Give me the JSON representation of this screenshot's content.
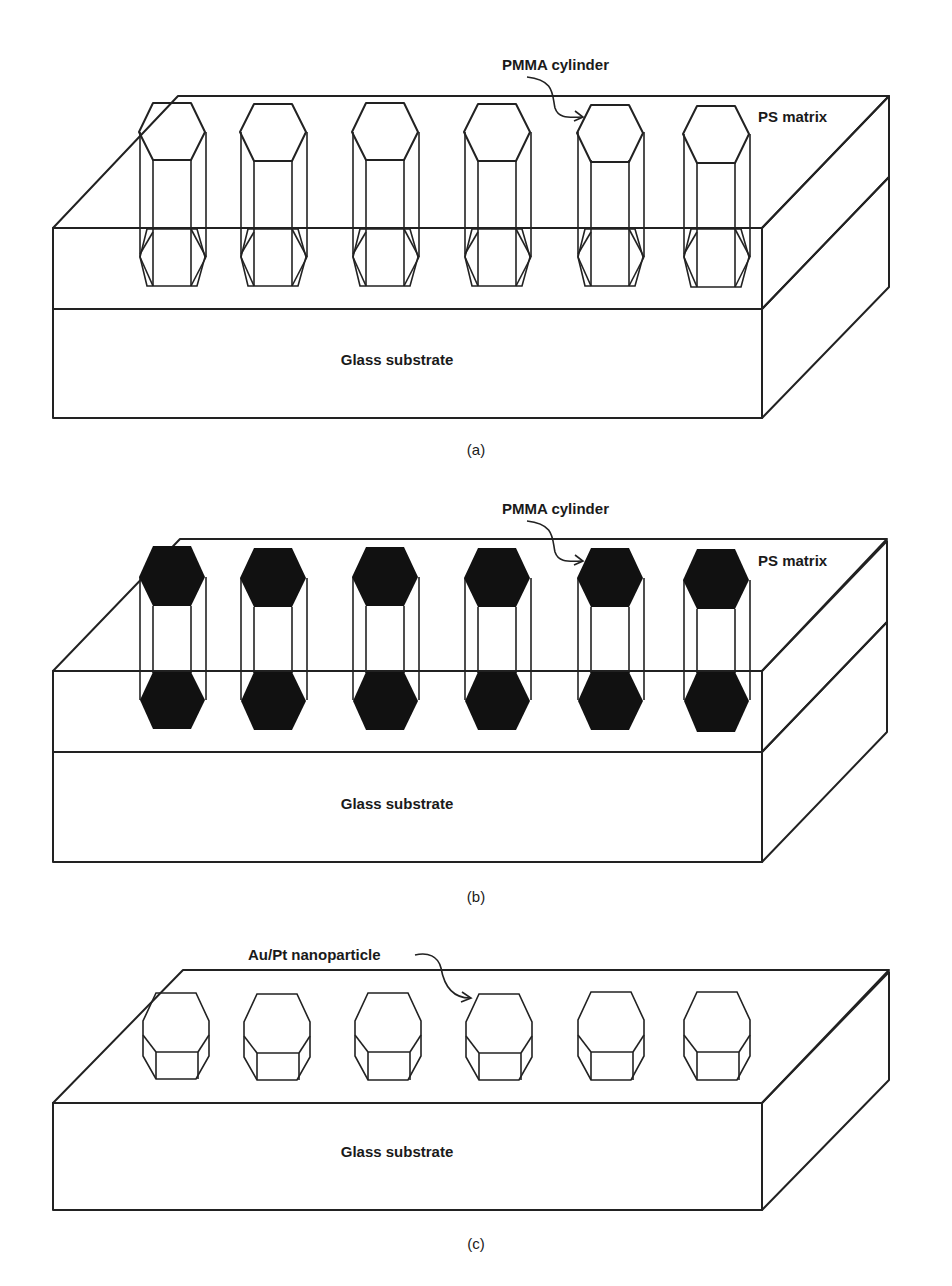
{
  "figure": {
    "panels": [
      {
        "id": "a",
        "caption": "(a)",
        "labels": {
          "cylinder": "PMMA cylinder",
          "matrix": "PS matrix",
          "substrate": "Glass substrate"
        },
        "cylinder_style": "open-white",
        "cylinder_count": 6
      },
      {
        "id": "b",
        "caption": "(b)",
        "labels": {
          "cylinder": "PMMA cylinder",
          "matrix": "PS matrix",
          "substrate": "Glass substrate"
        },
        "cylinder_style": "filled-black",
        "cylinder_count": 6
      },
      {
        "id": "c",
        "caption": "(c)",
        "labels": {
          "particle": "Au/Pt nanoparticle",
          "substrate": "Glass substrate"
        },
        "particle_style": "hatched",
        "particle_count": 6
      }
    ],
    "colors": {
      "ps_matrix": "#d9d9d9",
      "ps_matrix_front": "#d4d4d4",
      "ps_side_dark": "#aaaaaa",
      "glass_side": "#cfcfcf",
      "glass": "#ffffff",
      "line": "#222222",
      "filled_cylinder": "#111111"
    }
  }
}
